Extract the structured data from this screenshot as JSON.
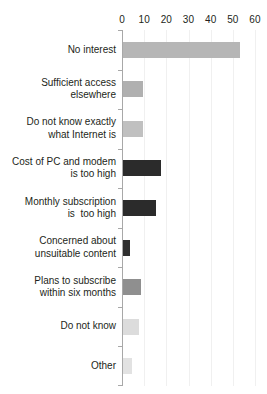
{
  "chart_data": {
    "type": "bar",
    "orientation": "horizontal",
    "title": "",
    "xlabel": "",
    "ylabel": "",
    "xlim": [
      0,
      60
    ],
    "grid": true,
    "legend": null,
    "xticks": [
      0,
      10,
      20,
      30,
      40,
      50,
      60
    ],
    "xtick_labels": [
      "0",
      "10",
      "20",
      "30",
      "40",
      "50",
      "60"
    ],
    "categories": [
      "No interest",
      "Sufficient access\nelsewhere",
      "Do not know exactly\nwhat Internet is",
      "Cost of PC and modem\nis too high",
      "Monthly subscription\nis  too high",
      "Concerned about\nunsuitable content",
      "Plans to subscribe\nwithin six months",
      "Do not know",
      "Other"
    ],
    "values": [
      53,
      9,
      9,
      17,
      15,
      3,
      8,
      7,
      4
    ],
    "bar_colors": [
      "#b6b6b6",
      "#b0b0b0",
      "#c0c0c0",
      "#2b2b2b",
      "#2b2b2b",
      "#2f2f2f",
      "#8f8f8f",
      "#dcdcdc",
      "#e2e2e2"
    ]
  },
  "colors": {
    "axis": "#a8a8a8",
    "grid": "#f0f0f0",
    "text": "#231f20",
    "background": "#ffffff"
  }
}
